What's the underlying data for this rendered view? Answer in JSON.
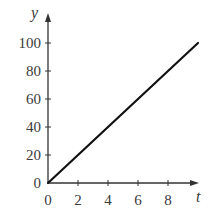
{
  "chart_data": {
    "type": "line",
    "title": "",
    "xlabel": "t",
    "ylabel": "y",
    "xlim": [
      0,
      10
    ],
    "ylim": [
      0,
      100
    ],
    "grid": false,
    "legend": null,
    "x_ticks": [
      0,
      2,
      4,
      6,
      8
    ],
    "y_ticks": [
      0,
      20,
      40,
      60,
      80,
      100
    ],
    "series": [
      {
        "name": "y",
        "x": [
          0,
          10
        ],
        "values": [
          0,
          100
        ],
        "color": "#111111"
      }
    ]
  },
  "colors": {
    "axis": "#333333",
    "line": "#111111",
    "text": "#3a3a3a",
    "background": "#ffffff"
  }
}
